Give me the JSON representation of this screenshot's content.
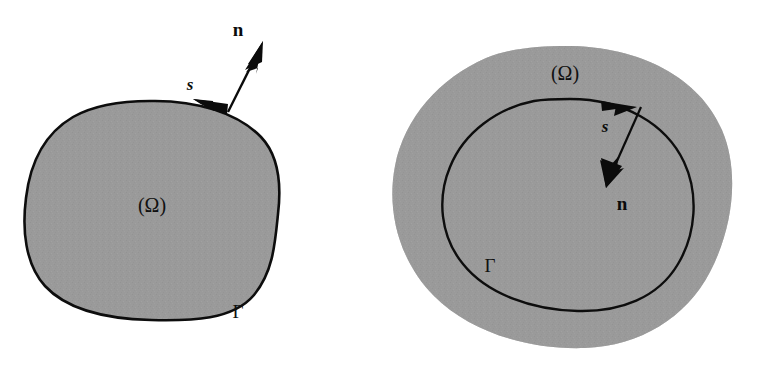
{
  "figure": {
    "width": 764,
    "height": 375,
    "background_color": "#ffffff"
  },
  "colors": {
    "shading_gray": "#969696",
    "shading_gray_light": "#a3a3a3",
    "outline_black": "#0d0d0d",
    "arrow_black": "#0b0b0b",
    "background_white": "#ffffff"
  },
  "panels": [
    {
      "id": "left-panel",
      "name": "simply-connected-domain",
      "region_type": "filled-blob",
      "fill": "shaded",
      "boundary_outline": "solid-black",
      "labels": {
        "domain": "(Ω)",
        "boundary": "Γ",
        "tangent": "s",
        "normal": "n"
      },
      "label_positions": {
        "domain": {
          "x": 152,
          "y": 212
        },
        "boundary": {
          "x": 238,
          "y": 318
        },
        "tangent": {
          "x": 190,
          "y": 90
        },
        "normal": {
          "x": 238,
          "y": 36
        }
      },
      "tangent_direction": "leftward-along-boundary",
      "normal_direction": "outward-up-right",
      "normal_arrow": {
        "tail_x": 228,
        "tail_y": 112,
        "tip_x": 262,
        "tip_y": 44
      }
    },
    {
      "id": "right-panel",
      "name": "annular-domain",
      "region_type": "annulus",
      "fill": "shaded-ring",
      "boundary_outline": "solid-black-inner-only",
      "labels": {
        "domain": "(Ω)",
        "boundary": "Γ",
        "tangent": "s",
        "normal": "n"
      },
      "label_positions": {
        "domain": {
          "x": 565,
          "y": 80
        },
        "boundary": {
          "x": 490,
          "y": 272
        },
        "tangent": {
          "x": 605,
          "y": 132
        },
        "normal": {
          "x": 622,
          "y": 210
        }
      },
      "tangent_direction": "rightward-along-boundary",
      "normal_direction": "inward-down-right",
      "normal_arrow": {
        "tail_x": 634,
        "tail_y": 112,
        "tip_x": 608,
        "tip_y": 182
      }
    }
  ]
}
